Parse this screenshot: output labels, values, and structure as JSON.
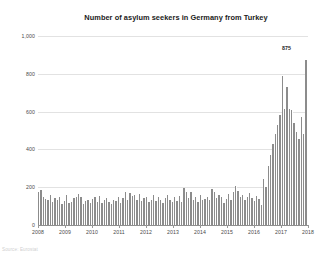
{
  "chart_data": {
    "type": "bar",
    "title": "Number of asylum seekers in Germany from Turkey",
    "xlabel": "",
    "ylabel": "",
    "ylim": [
      0,
      1000
    ],
    "yticks": [
      0,
      200,
      400,
      600,
      800,
      1000
    ],
    "ytick_labels": [
      "0",
      "200",
      "400",
      "600",
      "800",
      "1,000"
    ],
    "xtick_labels": [
      "2008",
      "2009",
      "2010",
      "2011",
      "2012",
      "2013",
      "2014",
      "2015",
      "2016",
      "2017",
      "2018"
    ],
    "grid": true,
    "legend": null,
    "bar_color": "#8c8c8c",
    "gridline_color": "#e2e2e2",
    "annotations": [
      {
        "label": "875",
        "value": 875,
        "note": "value label above final peak bar"
      }
    ],
    "x_note": "monthly observations from January 2008 through mid-2017",
    "categories": [
      "2008-01",
      "2008-02",
      "2008-03",
      "2008-04",
      "2008-05",
      "2008-06",
      "2008-07",
      "2008-08",
      "2008-09",
      "2008-10",
      "2008-11",
      "2008-12",
      "2009-01",
      "2009-02",
      "2009-03",
      "2009-04",
      "2009-05",
      "2009-06",
      "2009-07",
      "2009-08",
      "2009-09",
      "2009-10",
      "2009-11",
      "2009-12",
      "2010-01",
      "2010-02",
      "2010-03",
      "2010-04",
      "2010-05",
      "2010-06",
      "2010-07",
      "2010-08",
      "2010-09",
      "2010-10",
      "2010-11",
      "2010-12",
      "2011-01",
      "2011-02",
      "2011-03",
      "2011-04",
      "2011-05",
      "2011-06",
      "2011-07",
      "2011-08",
      "2011-09",
      "2011-10",
      "2011-11",
      "2011-12",
      "2012-01",
      "2012-02",
      "2012-03",
      "2012-04",
      "2012-05",
      "2012-06",
      "2012-07",
      "2012-08",
      "2012-09",
      "2012-10",
      "2012-11",
      "2012-12",
      "2013-01",
      "2013-02",
      "2013-03",
      "2013-04",
      "2013-05",
      "2013-06",
      "2013-07",
      "2013-08",
      "2013-09",
      "2013-10",
      "2013-11",
      "2013-12",
      "2014-01",
      "2014-02",
      "2014-03",
      "2014-04",
      "2014-05",
      "2014-06",
      "2014-07",
      "2014-08",
      "2014-09",
      "2014-10",
      "2014-11",
      "2014-12",
      "2015-01",
      "2015-02",
      "2015-03",
      "2015-04",
      "2015-05",
      "2015-06",
      "2015-07",
      "2015-08",
      "2015-09",
      "2015-10",
      "2015-11",
      "2015-12",
      "2016-01",
      "2016-02",
      "2016-03",
      "2016-04",
      "2016-05",
      "2016-06",
      "2016-07",
      "2016-08",
      "2016-09",
      "2016-10",
      "2016-11",
      "2016-12",
      "2017-01",
      "2017-02",
      "2017-03",
      "2017-04",
      "2017-05",
      "2017-06",
      "2017-07"
    ],
    "values": [
      175,
      185,
      150,
      140,
      130,
      160,
      120,
      145,
      135,
      150,
      110,
      125,
      160,
      115,
      120,
      145,
      150,
      165,
      150,
      110,
      125,
      130,
      115,
      140,
      150,
      120,
      155,
      115,
      130,
      145,
      120,
      110,
      135,
      125,
      150,
      115,
      145,
      175,
      130,
      170,
      155,
      160,
      130,
      165,
      125,
      145,
      150,
      120,
      135,
      160,
      125,
      150,
      135,
      115,
      145,
      160,
      130,
      120,
      150,
      125,
      155,
      120,
      195,
      175,
      145,
      175,
      130,
      150,
      120,
      160,
      135,
      140,
      150,
      130,
      190,
      175,
      145,
      160,
      150,
      115,
      140,
      165,
      130,
      175,
      205,
      180,
      150,
      160,
      135,
      150,
      170,
      145,
      125,
      155,
      140,
      105,
      245,
      200,
      310,
      370,
      430,
      480,
      530,
      580,
      790,
      615,
      730,
      615,
      610,
      540,
      490,
      455,
      570,
      480,
      875
    ]
  },
  "source_note": "Source: Eurostat"
}
